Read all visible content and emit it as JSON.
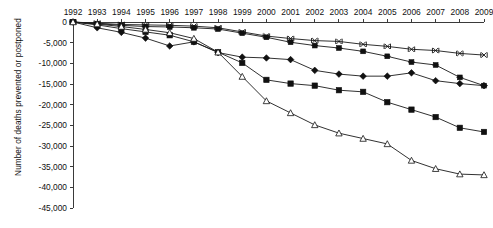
{
  "chart_data": {
    "type": "line",
    "title": "",
    "xlabel": "",
    "ylabel": "Number of deaths prevented or postponed",
    "x": [
      1992,
      1993,
      1994,
      1995,
      1996,
      1997,
      1998,
      1999,
      2000,
      2001,
      2002,
      2003,
      2004,
      2005,
      2006,
      2007,
      2008,
      2009
    ],
    "categories": [
      "1992",
      "1993",
      "1994",
      "1995",
      "1996",
      "1997",
      "1998",
      "1999",
      "2000",
      "2001",
      "2002",
      "2003",
      "2004",
      "2005",
      "2006",
      "2007",
      "2008",
      "2009"
    ],
    "ylim": [
      -45000,
      0
    ],
    "xlim": [
      1992,
      2009
    ],
    "yticks": [
      0,
      -5000,
      -10000,
      -15000,
      -20000,
      -25000,
      -30000,
      -35000,
      -40000,
      -45000
    ],
    "ytick_labels": [
      "0",
      "-5,000",
      "-10,000",
      "-15,000",
      "-20,000",
      "-25,000",
      "-30,000",
      "-35,000",
      "-40,000",
      "-45,000"
    ],
    "grid": false,
    "legend": "none",
    "series": [
      {
        "name": "series-cross",
        "marker": "cross",
        "values": [
          0,
          -300,
          -600,
          -700,
          -800,
          -1000,
          -1400,
          -2400,
          -3400,
          -4000,
          -4500,
          -4700,
          -5400,
          -5900,
          -6600,
          -6900,
          -7600,
          -8000
        ]
      },
      {
        "name": "series-star",
        "marker": "star",
        "values": [
          0,
          -400,
          -800,
          -1100,
          -1200,
          -1400,
          -1700,
          -2700,
          -3700,
          -4900,
          -5700,
          -6300,
          -7100,
          -8300,
          -9700,
          -10400,
          -13400,
          -15400
        ]
      },
      {
        "name": "series-diamond",
        "marker": "diamond",
        "values": [
          0,
          -1400,
          -2500,
          -3900,
          -5800,
          -4800,
          -7400,
          -8500,
          -8700,
          -9100,
          -11700,
          -12600,
          -13100,
          -13100,
          -12300,
          -14200,
          -14900,
          -15400
        ]
      },
      {
        "name": "series-square",
        "marker": "square",
        "values": [
          0,
          -700,
          -1600,
          -2400,
          -3200,
          -4800,
          -7300,
          -9900,
          -14000,
          -14900,
          -15400,
          -16500,
          -16900,
          -19400,
          -21200,
          -23000,
          -25600,
          -26600
        ]
      },
      {
        "name": "series-open-triangle",
        "marker": "open-triangle",
        "values": [
          0,
          -500,
          -1100,
          -1800,
          -2600,
          -4000,
          -7300,
          -13200,
          -19100,
          -22000,
          -24900,
          -26900,
          -28200,
          -29500,
          -33500,
          -35500,
          -36800,
          -37000
        ]
      }
    ]
  }
}
